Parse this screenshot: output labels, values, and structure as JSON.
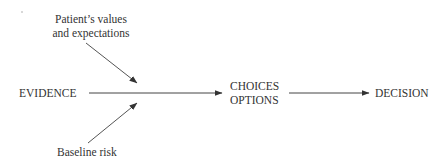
{
  "diagram": {
    "nodes": {
      "values": {
        "line1": "Patient’s values",
        "line2": "and expectations"
      },
      "evidence": {
        "label": "EVIDENCE"
      },
      "choices": {
        "line1": "CHOICES",
        "line2": "OPTIONS"
      },
      "decision": {
        "label": "DECISION"
      },
      "risk": {
        "label": "Baseline risk"
      }
    },
    "edges": [
      {
        "from": "EVIDENCE",
        "to": "CHOICES OPTIONS"
      },
      {
        "from": "Patient’s values and expectations",
        "to": "EVIDENCE → CHOICES arrow"
      },
      {
        "from": "Baseline risk",
        "to": "EVIDENCE → CHOICES arrow"
      },
      {
        "from": "CHOICES OPTIONS",
        "to": "DECISION"
      }
    ],
    "colors": {
      "line": "#444444",
      "text": "#333333",
      "background": "#ffffff"
    }
  }
}
